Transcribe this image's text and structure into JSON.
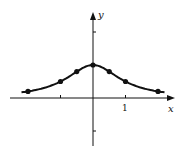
{
  "chart_data": {
    "type": "line",
    "title": "",
    "xlabel": "x",
    "ylabel": "y",
    "x_tick_labels": [
      {
        "value": 1,
        "label": "1"
      }
    ],
    "x_ticks": [
      -1,
      1
    ],
    "y_ticks": [
      -1,
      2
    ],
    "xlim": [
      -2.6,
      3.0
    ],
    "ylim": [
      -1.6,
      2.6
    ],
    "grid": false,
    "series": [
      {
        "name": "curve",
        "x": [
          -2,
          -1,
          -0.5,
          0,
          0.5,
          1,
          2
        ],
        "values": [
          0.2,
          0.5,
          0.8,
          1.0,
          0.8,
          0.5,
          0.2
        ],
        "markers": true
      }
    ],
    "curve_extends": [
      -2.2,
      2.2
    ]
  },
  "axes": {
    "x_label": "x",
    "y_label": "y",
    "tick_1_label": "1"
  },
  "style": {
    "ink": "#111111",
    "background": "#ffffff"
  }
}
